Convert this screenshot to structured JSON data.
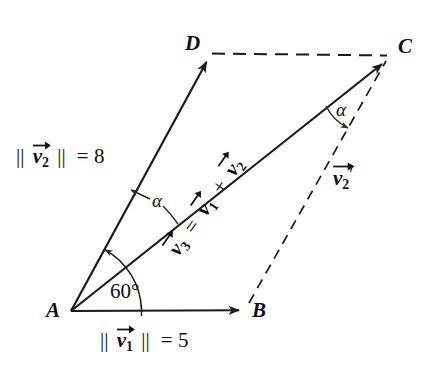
{
  "figure": {
    "type": "vector-parallelogram-diagram",
    "background_color": "#ffffff",
    "stroke_color": "#1a1a1a",
    "width": 441,
    "height": 370
  },
  "vertices": [
    {
      "name": "A",
      "label": "A",
      "x": 71,
      "y": 311,
      "label_x": 46,
      "label_y": 300
    },
    {
      "name": "B",
      "label": "B",
      "x": 246,
      "y": 310,
      "label_x": 252,
      "label_y": 300
    },
    {
      "name": "C",
      "label": "C",
      "x": 388,
      "y": 58,
      "label_x": 398,
      "label_y": 36
    },
    {
      "name": "D",
      "label": "D",
      "x": 210,
      "y": 56,
      "label_x": 185,
      "label_y": 33
    }
  ],
  "edges": [
    {
      "name": "AB",
      "style": "solid-arrow",
      "from": "A",
      "to": "B",
      "vector": "v1"
    },
    {
      "name": "AD",
      "style": "solid-arrow",
      "from": "A",
      "to": "D",
      "vector": "v2"
    },
    {
      "name": "AC",
      "style": "solid-arrow",
      "from": "A",
      "to": "C",
      "vector": "v3"
    },
    {
      "name": "DC",
      "style": "dashed",
      "from": "D",
      "to": "C",
      "vector": ""
    },
    {
      "name": "BC",
      "style": "dashed",
      "from": "B",
      "to": "C",
      "vector": "v2prime"
    }
  ],
  "labels": {
    "magnitude_v2": {
      "bars": "||",
      "vec": "v",
      "sub": "2",
      "eq": "= 8",
      "value": 8,
      "text": "|| v2 || = 8",
      "x": 16,
      "y": 146
    },
    "magnitude_v1": {
      "bars": "||",
      "vec": "v",
      "sub": "1",
      "eq": "= 5",
      "value": 5,
      "text": "|| v1 || = 5",
      "x": 100,
      "y": 330
    },
    "angle_base": {
      "text": "60°",
      "value": 60,
      "unit": "degrees",
      "x": 110,
      "y": 281
    },
    "angle_alpha_left": {
      "text": "α",
      "x": 152,
      "y": 191
    },
    "angle_alpha_right": {
      "text": "α",
      "x": 336,
      "y": 100
    },
    "diagonal_expr": {
      "parts": [
        "v3",
        "=",
        "v1",
        "+",
        "v2"
      ],
      "text": "v3 = v1 + v2",
      "rotation_deg": -54.8,
      "x": 174,
      "y": 240
    },
    "v2_prime": {
      "vec": "v",
      "sub": "2",
      "prime": "′",
      "text": "v2'",
      "x": 333,
      "y": 167
    }
  },
  "icons": {
    "arrowhead": "arrowhead-icon",
    "vector-accent": "vector-arrow-accent-icon",
    "angle-arc": "angle-arc-icon"
  }
}
